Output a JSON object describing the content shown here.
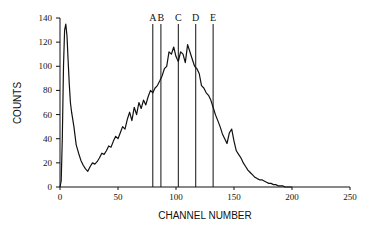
{
  "chart_data": {
    "type": "line",
    "title": "",
    "xlabel": "CHANNEL NUMBER",
    "ylabel": "COUNTS",
    "xlim": [
      0,
      250
    ],
    "ylim": [
      0,
      140
    ],
    "xticks": [
      0,
      50,
      100,
      150,
      200,
      250
    ],
    "yticks": [
      0,
      20,
      40,
      60,
      80,
      100,
      120,
      140
    ],
    "grid": false,
    "legend": null,
    "markers": [
      {
        "label": "A",
        "x": 80
      },
      {
        "label": "B",
        "x": 87
      },
      {
        "label": "C",
        "x": 102
      },
      {
        "label": "D",
        "x": 117
      },
      {
        "label": "E",
        "x": 132
      }
    ],
    "series": [
      {
        "name": "spectrum",
        "x": [
          0,
          1,
          2,
          3,
          4,
          5,
          6,
          7,
          8,
          9,
          10,
          12,
          14,
          16,
          18,
          20,
          22,
          24,
          26,
          28,
          30,
          32,
          34,
          36,
          38,
          40,
          42,
          44,
          46,
          48,
          50,
          52,
          54,
          56,
          58,
          60,
          62,
          64,
          66,
          68,
          70,
          72,
          74,
          76,
          78,
          80,
          82,
          84,
          86,
          88,
          90,
          92,
          94,
          96,
          98,
          100,
          102,
          104,
          106,
          108,
          110,
          112,
          114,
          116,
          118,
          120,
          122,
          124,
          126,
          128,
          130,
          132,
          134,
          136,
          138,
          140,
          142,
          144,
          146,
          148,
          150,
          152,
          154,
          156,
          158,
          160,
          162,
          164,
          166,
          168,
          170,
          172,
          174,
          176,
          178,
          180,
          182,
          184,
          186,
          188,
          190,
          192,
          194,
          196,
          198,
          200
        ],
        "y": [
          0,
          5,
          40,
          100,
          130,
          135,
          125,
          105,
          85,
          70,
          62,
          50,
          35,
          28,
          22,
          18,
          15,
          13,
          17,
          20,
          19,
          21,
          24,
          28,
          27,
          30,
          34,
          33,
          38,
          42,
          40,
          45,
          50,
          48,
          56,
          62,
          55,
          66,
          60,
          70,
          65,
          72,
          68,
          75,
          80,
          78,
          82,
          84,
          88,
          92,
          98,
          100,
          112,
          110,
          116,
          108,
          104,
          112,
          110,
          103,
          118,
          112,
          106,
          100,
          98,
          94,
          84,
          82,
          78,
          76,
          72,
          66,
          60,
          55,
          50,
          44,
          40,
          36,
          45,
          48,
          38,
          30,
          27,
          24,
          20,
          17,
          14,
          12,
          10,
          8,
          7,
          6,
          6,
          5,
          4,
          3,
          3,
          2,
          2,
          1,
          1,
          1,
          0,
          0,
          0,
          0
        ]
      }
    ]
  }
}
